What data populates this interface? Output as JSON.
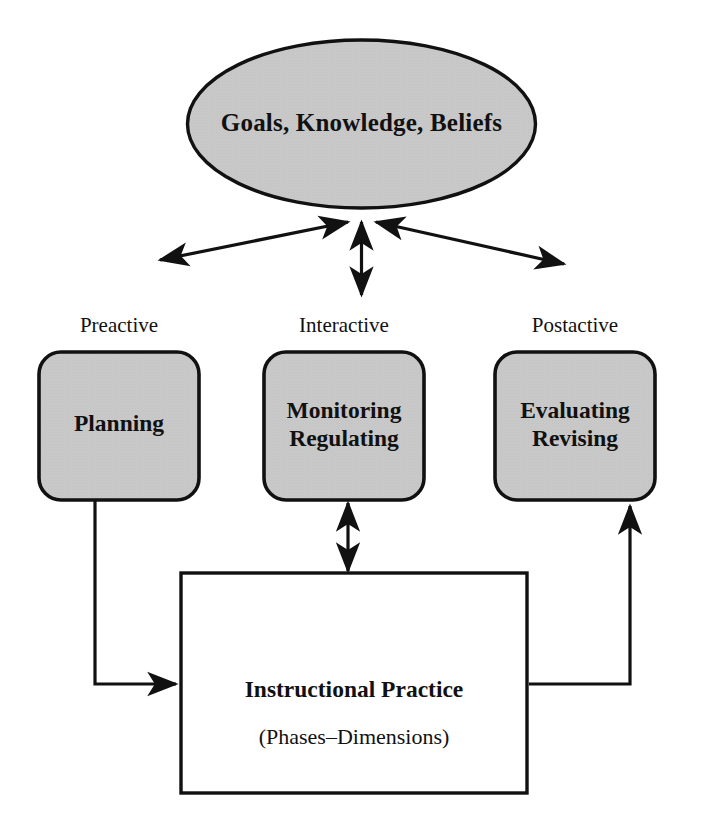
{
  "diagram": {
    "colors": {
      "fill_gray": "#c9c9c9",
      "stroke": "#000000",
      "background": "#ffffff",
      "text": "#111111"
    },
    "top_node": {
      "shape": "ellipse",
      "label": "Goals, Knowledge, Beliefs"
    },
    "phases": [
      {
        "caption": "Preactive",
        "box_label": "Planning",
        "shape": "rounded-rectangle"
      },
      {
        "caption": "Interactive",
        "box_label": "Monitoring\nRegulating",
        "shape": "rounded-rectangle"
      },
      {
        "caption": "Postactive",
        "box_label": "Evaluating\nRevising",
        "shape": "rounded-rectangle"
      }
    ],
    "bottom_node": {
      "shape": "rectangle",
      "title": "Instructional Practice",
      "subtitle": "(Phases–Dimensions)"
    },
    "connectors": [
      {
        "name": "ellipse-to-preactive",
        "style": "double-headed-arrow",
        "direction": "diagonal-left"
      },
      {
        "name": "ellipse-to-interactive",
        "style": "double-headed-arrow",
        "direction": "vertical"
      },
      {
        "name": "ellipse-to-postactive",
        "style": "double-headed-arrow",
        "direction": "diagonal-right"
      },
      {
        "name": "interactive-to-practice",
        "style": "double-headed-arrow",
        "direction": "vertical"
      },
      {
        "name": "planning-to-practice",
        "style": "elbow-arrow",
        "direction": "down-then-right"
      },
      {
        "name": "practice-to-evaluating",
        "style": "elbow-arrow",
        "direction": "right-then-up"
      }
    ]
  }
}
